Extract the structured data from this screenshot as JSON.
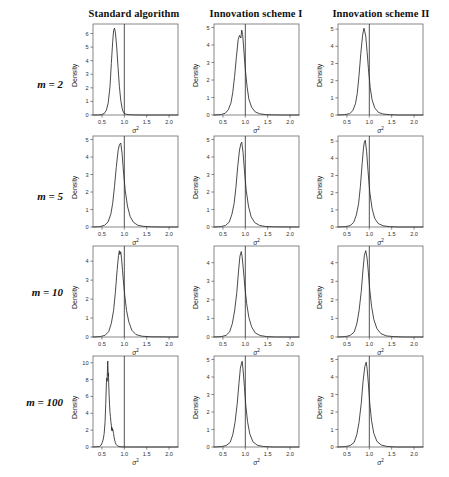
{
  "figure": {
    "columns": [
      {
        "id": "standard",
        "label": "Standard algorithm"
      },
      {
        "id": "scheme1",
        "label": "Innovation scheme I"
      },
      {
        "id": "scheme2",
        "label": "Innovation scheme II"
      }
    ],
    "rows": [
      {
        "id": "m2",
        "label": "m = 2",
        "m": 2
      },
      {
        "id": "m5",
        "label": "m = 5",
        "m": 5
      },
      {
        "id": "m10",
        "label": "m = 10",
        "m": 10
      },
      {
        "id": "m100",
        "label": "m = 100",
        "m": 100
      }
    ],
    "xlabel": "σ2",
    "ylabel": "Density",
    "reference_line_x": 1.0
  },
  "chart_data": [
    {
      "type": "line",
      "panel": "m=2 / Standard algorithm",
      "row": "m = 2",
      "column": "Standard algorithm",
      "title": "",
      "xlabel": "σ2",
      "ylabel": "Density",
      "xlim": [
        0.3,
        2.2
      ],
      "ylim": [
        0,
        6.7
      ],
      "xticks": [
        0.5,
        1.0,
        1.5,
        2.0
      ],
      "yticks": [
        0,
        1,
        2,
        3,
        4,
        5,
        6
      ],
      "grid": false,
      "legend": false,
      "reference_line_x": 1.0,
      "peak_x": 0.78,
      "peak_y": 6.4,
      "x": [
        0.3,
        0.4,
        0.48,
        0.55,
        0.6,
        0.64,
        0.68,
        0.71,
        0.74,
        0.76,
        0.78,
        0.8,
        0.83,
        0.86,
        0.89,
        0.92,
        0.95,
        0.98,
        1.0,
        1.05,
        1.12,
        1.2,
        1.35,
        1.55,
        1.8,
        2.2
      ],
      "y": [
        0.0,
        0.0,
        0.02,
        0.1,
        0.35,
        0.9,
        2.1,
        3.8,
        5.4,
        6.2,
        6.4,
        6.1,
        5.0,
        3.5,
        2.1,
        1.1,
        0.5,
        0.2,
        0.12,
        0.05,
        0.02,
        0.01,
        0.0,
        0.0,
        0.0,
        0.0
      ]
    },
    {
      "type": "line",
      "panel": "m=2 / Innovation scheme I",
      "row": "m = 2",
      "column": "Innovation scheme I",
      "title": "",
      "xlabel": "σ2",
      "ylabel": "Density",
      "xlim": [
        0.3,
        2.2
      ],
      "ylim": [
        0,
        5.2
      ],
      "xticks": [
        0.5,
        1.0,
        1.5,
        2.0
      ],
      "yticks": [
        0,
        1,
        2,
        3,
        4,
        5
      ],
      "grid": false,
      "legend": false,
      "reference_line_x": 1.0,
      "peak_x": 0.92,
      "peak_y": 4.85,
      "x": [
        0.3,
        0.45,
        0.55,
        0.62,
        0.68,
        0.72,
        0.76,
        0.8,
        0.84,
        0.87,
        0.9,
        0.92,
        0.94,
        0.97,
        1.0,
        1.04,
        1.08,
        1.14,
        1.22,
        1.32,
        1.45,
        1.6,
        1.8,
        2.2
      ],
      "y": [
        0.0,
        0.02,
        0.1,
        0.3,
        0.7,
        1.3,
        2.2,
        3.3,
        4.3,
        4.55,
        4.4,
        4.85,
        4.6,
        3.6,
        2.6,
        1.6,
        0.9,
        0.45,
        0.18,
        0.07,
        0.02,
        0.01,
        0.0,
        0.0
      ]
    },
    {
      "type": "line",
      "panel": "m=2 / Innovation scheme II",
      "row": "m = 2",
      "column": "Innovation scheme II",
      "title": "",
      "xlabel": "σ2",
      "ylabel": "Density",
      "xlim": [
        0.3,
        2.2
      ],
      "ylim": [
        0,
        5.3
      ],
      "xticks": [
        0.5,
        1.0,
        1.5,
        2.0
      ],
      "yticks": [
        0,
        1,
        2,
        3,
        4,
        5
      ],
      "grid": false,
      "legend": false,
      "reference_line_x": 1.0,
      "peak_x": 0.9,
      "peak_y": 5.05,
      "x": [
        0.3,
        0.45,
        0.56,
        0.63,
        0.69,
        0.73,
        0.77,
        0.81,
        0.85,
        0.88,
        0.9,
        0.92,
        0.95,
        0.98,
        1.02,
        1.06,
        1.12,
        1.2,
        1.3,
        1.45,
        1.65,
        2.2
      ],
      "y": [
        0.0,
        0.02,
        0.08,
        0.25,
        0.65,
        1.25,
        2.3,
        3.6,
        4.65,
        5.05,
        4.85,
        4.6,
        3.7,
        2.7,
        1.6,
        0.9,
        0.42,
        0.16,
        0.06,
        0.02,
        0.0,
        0.0
      ]
    },
    {
      "type": "line",
      "panel": "m=5 / Standard algorithm",
      "row": "m = 5",
      "column": "Standard algorithm",
      "title": "",
      "xlabel": "σ2",
      "ylabel": "Density",
      "xlim": [
        0.3,
        2.2
      ],
      "ylim": [
        0,
        5.2
      ],
      "xticks": [
        0.5,
        1.0,
        1.5,
        2.0
      ],
      "yticks": [
        0,
        1,
        2,
        3,
        4,
        5
      ],
      "grid": false,
      "legend": false,
      "reference_line_x": 1.0,
      "peak_x": 0.92,
      "peak_y": 4.8,
      "x": [
        0.3,
        0.45,
        0.56,
        0.64,
        0.7,
        0.74,
        0.78,
        0.82,
        0.86,
        0.89,
        0.92,
        0.95,
        0.98,
        1.02,
        1.07,
        1.13,
        1.2,
        1.3,
        1.42,
        1.6,
        1.85,
        2.2
      ],
      "y": [
        0.0,
        0.02,
        0.1,
        0.3,
        0.75,
        1.35,
        2.3,
        3.4,
        4.35,
        4.7,
        4.8,
        4.2,
        3.2,
        2.1,
        1.2,
        0.6,
        0.28,
        0.1,
        0.04,
        0.01,
        0.0,
        0.0
      ]
    },
    {
      "type": "line",
      "panel": "m=5 / Innovation scheme I",
      "row": "m = 5",
      "column": "Innovation scheme I",
      "title": "",
      "xlabel": "σ2",
      "ylabel": "Density",
      "xlim": [
        0.3,
        2.2
      ],
      "ylim": [
        0,
        5.2
      ],
      "xticks": [
        0.5,
        1.0,
        1.5,
        2.0
      ],
      "yticks": [
        0,
        1,
        2,
        3,
        4,
        5
      ],
      "grid": false,
      "legend": false,
      "reference_line_x": 1.0,
      "peak_x": 0.92,
      "peak_y": 4.85,
      "x": [
        0.3,
        0.45,
        0.56,
        0.64,
        0.7,
        0.75,
        0.79,
        0.83,
        0.87,
        0.9,
        0.92,
        0.95,
        0.98,
        1.02,
        1.07,
        1.13,
        1.21,
        1.32,
        1.45,
        1.65,
        2.2
      ],
      "y": [
        0.0,
        0.02,
        0.09,
        0.28,
        0.72,
        1.35,
        2.25,
        3.45,
        4.4,
        4.75,
        4.85,
        4.25,
        3.25,
        2.1,
        1.2,
        0.58,
        0.25,
        0.09,
        0.03,
        0.01,
        0.0
      ]
    },
    {
      "type": "line",
      "panel": "m=5 / Innovation scheme II",
      "row": "m = 5",
      "column": "Innovation scheme II",
      "title": "",
      "xlabel": "σ2",
      "ylabel": "Density",
      "xlim": [
        0.3,
        2.2
      ],
      "ylim": [
        0,
        5.3
      ],
      "xticks": [
        0.5,
        1.0,
        1.5,
        2.0
      ],
      "yticks": [
        0,
        1,
        2,
        3,
        4,
        5
      ],
      "grid": false,
      "legend": false,
      "reference_line_x": 1.0,
      "peak_x": 0.91,
      "peak_y": 5.05,
      "x": [
        0.3,
        0.46,
        0.57,
        0.65,
        0.71,
        0.76,
        0.8,
        0.84,
        0.87,
        0.89,
        0.91,
        0.94,
        0.97,
        1.01,
        1.06,
        1.12,
        1.2,
        1.31,
        1.45,
        1.65,
        2.2
      ],
      "y": [
        0.0,
        0.02,
        0.08,
        0.26,
        0.7,
        1.35,
        2.35,
        3.7,
        4.6,
        4.95,
        5.05,
        4.4,
        3.3,
        2.05,
        1.1,
        0.5,
        0.2,
        0.07,
        0.02,
        0.0,
        0.0
      ]
    },
    {
      "type": "line",
      "panel": "m=10 / Standard algorithm",
      "row": "m = 10",
      "column": "Standard algorithm",
      "title": "",
      "xlabel": "σ2",
      "ylabel": "Density",
      "xlim": [
        0.3,
        2.2
      ],
      "ylim": [
        0,
        4.8
      ],
      "xticks": [
        0.5,
        1.0,
        1.5,
        2.0
      ],
      "yticks": [
        0,
        1,
        2,
        3,
        4
      ],
      "grid": false,
      "legend": false,
      "reference_line_x": 1.0,
      "peak_x": 0.9,
      "peak_y": 4.55,
      "x": [
        0.3,
        0.46,
        0.57,
        0.65,
        0.71,
        0.76,
        0.8,
        0.84,
        0.87,
        0.89,
        0.9,
        0.92,
        0.94,
        0.96,
        0.98,
        1.01,
        1.05,
        1.1,
        1.17,
        1.26,
        1.4,
        1.6,
        2.2
      ],
      "y": [
        0.0,
        0.02,
        0.09,
        0.28,
        0.72,
        1.4,
        2.35,
        3.55,
        4.3,
        4.55,
        4.35,
        4.5,
        4.1,
        3.5,
        2.95,
        2.2,
        1.4,
        0.8,
        0.35,
        0.13,
        0.04,
        0.01,
        0.0
      ]
    },
    {
      "type": "line",
      "panel": "m=10 / Innovation scheme I",
      "row": "m = 10",
      "column": "Innovation scheme I",
      "title": "",
      "xlabel": "σ2",
      "ylabel": "Density",
      "xlim": [
        0.3,
        2.2
      ],
      "ylim": [
        0,
        4.9
      ],
      "xticks": [
        0.5,
        1.0,
        1.5,
        2.0
      ],
      "yticks": [
        0,
        1,
        2,
        3,
        4
      ],
      "grid": false,
      "legend": false,
      "reference_line_x": 1.0,
      "peak_x": 0.91,
      "peak_y": 4.6,
      "x": [
        0.3,
        0.46,
        0.57,
        0.65,
        0.71,
        0.76,
        0.81,
        0.85,
        0.88,
        0.91,
        0.93,
        0.96,
        0.99,
        1.03,
        1.08,
        1.14,
        1.22,
        1.33,
        1.48,
        1.7,
        2.2
      ],
      "y": [
        0.0,
        0.02,
        0.09,
        0.28,
        0.72,
        1.4,
        2.4,
        3.6,
        4.35,
        4.6,
        4.3,
        3.55,
        2.7,
        1.8,
        1.05,
        0.55,
        0.22,
        0.08,
        0.02,
        0.0,
        0.0
      ]
    },
    {
      "type": "line",
      "panel": "m=10 / Innovation scheme II",
      "row": "m = 10",
      "column": "Innovation scheme II",
      "title": "",
      "xlabel": "σ2",
      "ylabel": "Density",
      "xlim": [
        0.3,
        2.2
      ],
      "ylim": [
        0,
        4.9
      ],
      "xticks": [
        0.5,
        1.0,
        1.5,
        2.0
      ],
      "yticks": [
        0,
        1,
        2,
        3,
        4
      ],
      "grid": false,
      "legend": false,
      "reference_line_x": 1.0,
      "peak_x": 0.92,
      "peak_y": 4.65,
      "x": [
        0.3,
        0.46,
        0.57,
        0.66,
        0.72,
        0.77,
        0.82,
        0.86,
        0.89,
        0.92,
        0.95,
        0.98,
        1.01,
        1.05,
        1.1,
        1.17,
        1.26,
        1.38,
        1.55,
        1.8,
        2.2
      ],
      "y": [
        0.0,
        0.02,
        0.08,
        0.26,
        0.7,
        1.4,
        2.45,
        3.65,
        4.4,
        4.65,
        4.25,
        3.45,
        2.55,
        1.65,
        0.95,
        0.45,
        0.18,
        0.06,
        0.02,
        0.0,
        0.0
      ]
    },
    {
      "type": "line",
      "panel": "m=100 / Standard algorithm",
      "row": "m = 100",
      "column": "Standard algorithm",
      "title": "",
      "xlabel": "σ2",
      "ylabel": "Density",
      "xlim": [
        0.3,
        2.2
      ],
      "ylim": [
        0,
        10.8
      ],
      "xticks": [
        0.5,
        1.0,
        1.5,
        2.0
      ],
      "yticks": [
        0,
        2,
        4,
        6,
        8,
        10
      ],
      "grid": false,
      "legend": false,
      "reference_line_x": 1.0,
      "peak_x": 0.62,
      "peak_y": 10.2,
      "x": [
        0.3,
        0.44,
        0.48,
        0.51,
        0.53,
        0.55,
        0.57,
        0.585,
        0.6,
        0.61,
        0.615,
        0.62,
        0.625,
        0.63,
        0.635,
        0.64,
        0.645,
        0.65,
        0.66,
        0.67,
        0.68,
        0.69,
        0.7,
        0.71,
        0.715,
        0.72,
        0.725,
        0.73,
        0.735,
        0.74,
        0.75,
        0.76,
        0.77,
        0.785,
        0.8,
        0.82,
        0.85,
        0.9,
        1.0,
        1.2,
        1.6,
        2.2
      ],
      "y": [
        0.0,
        0.05,
        0.2,
        0.55,
        0.95,
        1.6,
        3.0,
        5.2,
        7.6,
        8.2,
        7.8,
        8.6,
        9.6,
        10.2,
        9.4,
        8.4,
        8.8,
        7.6,
        6.2,
        5.0,
        4.1,
        3.6,
        3.0,
        2.6,
        2.1,
        2.35,
        1.9,
        2.2,
        1.95,
        2.1,
        1.9,
        1.6,
        1.2,
        0.8,
        0.5,
        0.28,
        0.12,
        0.03,
        0.0,
        0.0,
        0.0,
        0.0
      ]
    },
    {
      "type": "line",
      "panel": "m=100 / Innovation scheme I",
      "row": "m = 100",
      "column": "Innovation scheme I",
      "title": "",
      "xlabel": "σ2",
      "ylabel": "Density",
      "xlim": [
        0.3,
        2.2
      ],
      "ylim": [
        0,
        5.2
      ],
      "xticks": [
        0.5,
        1.0,
        1.5,
        2.0
      ],
      "yticks": [
        0,
        1,
        2,
        3,
        4,
        5
      ],
      "grid": false,
      "legend": false,
      "reference_line_x": 1.0,
      "peak_x": 0.93,
      "peak_y": 4.9,
      "x": [
        0.3,
        0.46,
        0.57,
        0.66,
        0.72,
        0.77,
        0.82,
        0.86,
        0.89,
        0.92,
        0.93,
        0.95,
        0.98,
        1.01,
        1.05,
        1.1,
        1.17,
        1.27,
        1.4,
        1.6,
        2.2
      ],
      "y": [
        0.0,
        0.02,
        0.08,
        0.26,
        0.7,
        1.4,
        2.5,
        3.7,
        4.5,
        4.85,
        4.9,
        4.4,
        3.45,
        2.4,
        1.45,
        0.75,
        0.3,
        0.1,
        0.03,
        0.0,
        0.0
      ]
    },
    {
      "type": "line",
      "panel": "m=100 / Innovation scheme II",
      "row": "m = 100",
      "column": "Innovation scheme II",
      "title": "",
      "xlabel": "σ2",
      "ylabel": "Density",
      "xlim": [
        0.3,
        2.2
      ],
      "ylim": [
        0,
        5.2
      ],
      "xticks": [
        0.5,
        1.0,
        1.5,
        2.0
      ],
      "yticks": [
        0,
        1,
        2,
        3,
        4,
        5
      ],
      "grid": false,
      "legend": false,
      "reference_line_x": 1.0,
      "peak_x": 0.93,
      "peak_y": 4.85,
      "x": [
        0.3,
        0.46,
        0.57,
        0.66,
        0.72,
        0.77,
        0.82,
        0.86,
        0.9,
        0.93,
        0.95,
        0.98,
        1.01,
        1.05,
        1.1,
        1.17,
        1.27,
        1.4,
        1.6,
        2.2
      ],
      "y": [
        0.0,
        0.02,
        0.08,
        0.26,
        0.7,
        1.4,
        2.5,
        3.75,
        4.6,
        4.85,
        4.5,
        3.6,
        2.5,
        1.5,
        0.78,
        0.32,
        0.11,
        0.03,
        0.0,
        0.0
      ]
    }
  ]
}
